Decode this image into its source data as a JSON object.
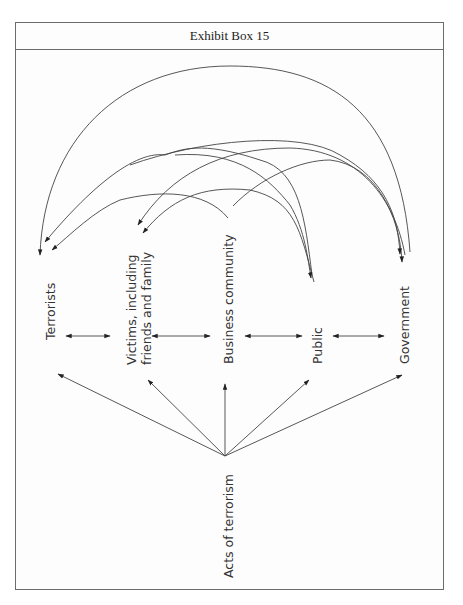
{
  "header": {
    "title": "Exhibit Box 15"
  },
  "nodes": [
    {
      "id": "terrorists",
      "lines": [
        "Terrorists"
      ]
    },
    {
      "id": "victims",
      "lines": [
        "Victims, including",
        "friends and family"
      ]
    },
    {
      "id": "business",
      "lines": [
        "Business community"
      ]
    },
    {
      "id": "public",
      "lines": [
        "Public"
      ]
    },
    {
      "id": "government",
      "lines": [
        "Government"
      ]
    }
  ],
  "source": {
    "id": "acts",
    "lines": [
      "Acts of terrorism"
    ]
  },
  "colors": {
    "line": "#444444",
    "border": "#6b6b6b",
    "text": "#333333"
  }
}
